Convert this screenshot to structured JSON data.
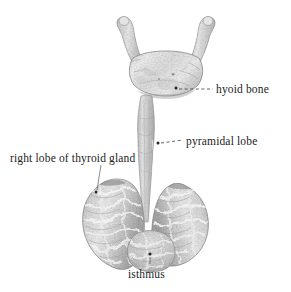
{
  "figure": {
    "background_color": "#ffffff",
    "label_color": "#1d1d1d",
    "leader_color": "#3a3a3a",
    "illustration_style": "engraved halftone anatomical plate, grayscale"
  },
  "labels": [
    {
      "id": "hyoid-bone",
      "text": "hyoid bone",
      "position": {
        "x": 216,
        "y": 83
      },
      "leader": {
        "style": "dashed",
        "from": {
          "x": 178,
          "y": 89
        },
        "to": {
          "x": 213,
          "y": 89
        },
        "marker": "dot"
      }
    },
    {
      "id": "pyramidal-lobe",
      "text": "pyramidal lobe",
      "position": {
        "x": 186,
        "y": 135
      },
      "leader": {
        "style": "dashed",
        "from": {
          "x": 159,
          "y": 143
        },
        "to": {
          "x": 183,
          "y": 141
        },
        "marker": "dot"
      }
    },
    {
      "id": "right-lobe-of-thyroid-gland",
      "text": "right lobe of thyroid gland",
      "position": {
        "x": 10,
        "y": 152
      },
      "leader": {
        "style": "solid",
        "from": {
          "x": 101,
          "y": 166
        },
        "to": {
          "x": 96,
          "y": 192
        },
        "marker": "dot"
      }
    },
    {
      "id": "isthmus",
      "text": "isthmus",
      "position": {
        "x": 128,
        "y": 268
      },
      "leader": {
        "style": "solid",
        "from": {
          "x": 150,
          "y": 256
        },
        "to": {
          "x": 150,
          "y": 264
        },
        "marker": "dot"
      }
    }
  ],
  "structures": [
    {
      "id": "hyoid-bone-body",
      "name": "hyoid bone",
      "region": "superior, U-shaped bone with greater horns"
    },
    {
      "id": "pyramidal-lobe",
      "name": "pyramidal lobe",
      "region": "narrow vertical band descending from hyoid to isthmus"
    },
    {
      "id": "right-lobe",
      "name": "right lobe of thyroid gland",
      "region": "left side of image, viewer's left"
    },
    {
      "id": "left-lobe",
      "name": "left lobe of thyroid gland",
      "region": "right side of image, viewer's right"
    },
    {
      "id": "isthmus",
      "name": "isthmus",
      "region": "inferior bridge joining the two lobes"
    }
  ]
}
